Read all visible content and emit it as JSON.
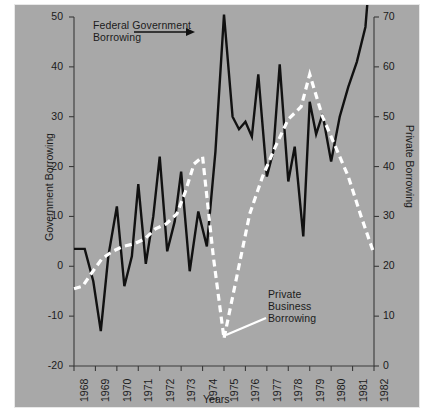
{
  "figure": {
    "background_color": "#a8a8a8",
    "border_color": "#e8e8e8",
    "axis_color": "#3a3a3a"
  },
  "annotations": {
    "federal": "Federal Government\nBorrowing",
    "private": "Private\nBusiness\nBorrowing"
  },
  "chart_data": {
    "type": "line",
    "title": "",
    "xlabel": "Years",
    "ylabel": "Government Borrowing",
    "y2label": "Private Borrowing",
    "grid": false,
    "legend": "annotated-callouts",
    "xlim": [
      1968,
      1982
    ],
    "ylim": [
      -20,
      50
    ],
    "y2lim": [
      0,
      70
    ],
    "yticks": [
      -20,
      -10,
      0,
      10,
      20,
      30,
      40,
      50
    ],
    "ytick_labels": [
      "-20",
      "-10",
      "0",
      "10",
      "20",
      "30",
      "40",
      "50"
    ],
    "y2ticks": [
      0,
      10,
      20,
      30,
      40,
      50,
      60,
      70
    ],
    "y2tick_labels": [
      "0",
      "10",
      "20",
      "30",
      "40",
      "50",
      "60",
      "70"
    ],
    "xticks": [
      1968,
      1969,
      1970,
      1971,
      1972,
      1973,
      1974,
      1975,
      1976,
      1977,
      1978,
      1979,
      1980,
      1981,
      1982
    ],
    "xtick_labels": [
      "1968",
      "1969",
      "1970",
      "1971",
      "1972",
      "1973",
      "1974",
      "1975",
      "1976",
      "1977",
      "1978",
      "1979",
      "1980",
      "1981",
      "1982"
    ],
    "series": [
      {
        "name": "Federal Government Borrowing",
        "axis": "left",
        "style": "solid",
        "color": "#111111",
        "x": [
          1968.0,
          1968.5,
          1968.9,
          1969.25,
          1969.6,
          1970.0,
          1970.35,
          1970.7,
          1971.0,
          1971.35,
          1971.7,
          1972.0,
          1972.35,
          1972.7,
          1973.0,
          1973.4,
          1973.8,
          1974.2,
          1974.6,
          1975.0,
          1975.4,
          1975.7,
          1976.0,
          1976.3,
          1976.6,
          1977.0,
          1977.3,
          1977.6,
          1978.0,
          1978.3,
          1978.7,
          1979.0,
          1979.3,
          1979.6,
          1980.0,
          1980.4,
          1980.8,
          1981.2,
          1981.6,
          1982.0
        ],
        "y": [
          3.5,
          3.5,
          -3.0,
          -13.0,
          2.0,
          12.0,
          -4.0,
          2.0,
          16.5,
          0.5,
          10.0,
          22.0,
          3.0,
          9.0,
          19.0,
          -1.0,
          11.0,
          4.0,
          23.0,
          50.5,
          30.0,
          27.5,
          29.0,
          26.0,
          38.5,
          18.0,
          23.0,
          40.5,
          17.0,
          24.0,
          6.0,
          33.0,
          26.5,
          30.5,
          21.0,
          30.0,
          36.0,
          41.0,
          48.0,
          69.0
        ]
      },
      {
        "name": "Private Business Borrowing",
        "axis": "right",
        "style": "dashed",
        "color": "#ffffff",
        "x": [
          1968.0,
          1968.4,
          1968.8,
          1969.3,
          1969.8,
          1970.3,
          1970.8,
          1971.3,
          1971.8,
          1972.3,
          1972.8,
          1973.2,
          1973.6,
          1974.0,
          1974.5,
          1975.0,
          1975.6,
          1976.2,
          1976.8,
          1977.4,
          1978.0,
          1978.6,
          1979.0,
          1979.6,
          1980.2,
          1980.8,
          1981.4,
          1982.0
        ],
        "y": [
          15.5,
          16.0,
          18.5,
          21.5,
          23.0,
          24.0,
          24.5,
          25.5,
          27.5,
          28.5,
          30.5,
          35.0,
          40.5,
          42.0,
          22.0,
          5.5,
          18.0,
          30.5,
          38.0,
          44.0,
          49.5,
          52.0,
          58.5,
          50.0,
          44.0,
          38.0,
          30.0,
          22.5
        ]
      }
    ]
  }
}
